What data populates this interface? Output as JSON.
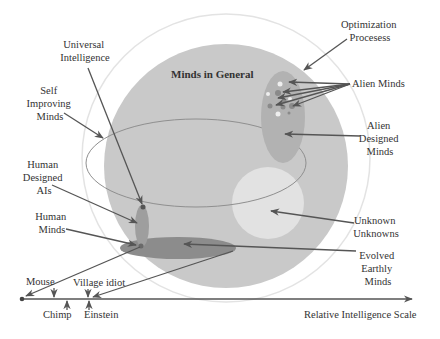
{
  "diagram": {
    "title": "Minds in General",
    "labels": {
      "optimization_processes": [
        "Optimization",
        "Procesess"
      ],
      "alien_minds": "Alien Minds",
      "alien_designed_minds": [
        "Alien",
        "Designed",
        "Minds"
      ],
      "unknown_unknowns": [
        "Unknown",
        "Unknowns"
      ],
      "evolved_earthly_minds": [
        "Evolved",
        "Earthly",
        "Minds"
      ],
      "universal_intelligence": [
        "Universal",
        "Intelligence"
      ],
      "self_improving_minds": [
        "Self",
        "Improving",
        "Minds"
      ],
      "human_designed_ais": [
        "Human",
        "Designed",
        "AIs"
      ],
      "human_minds": [
        "Human",
        "Minds"
      ]
    },
    "scale": {
      "axis_label": "Relative Intelligence Scale",
      "markers": {
        "mouse": "Mouse",
        "chimp": "Chimp",
        "village_idiot": "Village idiot",
        "einstein": "Einstein"
      }
    },
    "colors": {
      "minds_in_general": "#c9c9c9",
      "outer_ring": "#e6e6e6",
      "alien_designed": "#b0b0b0",
      "unknown_unknowns": "#e2e2e2",
      "evolved_earthly": "#8c8c8c",
      "human_designed_ais": "#9e9e9e",
      "arrow": "#555555"
    }
  }
}
